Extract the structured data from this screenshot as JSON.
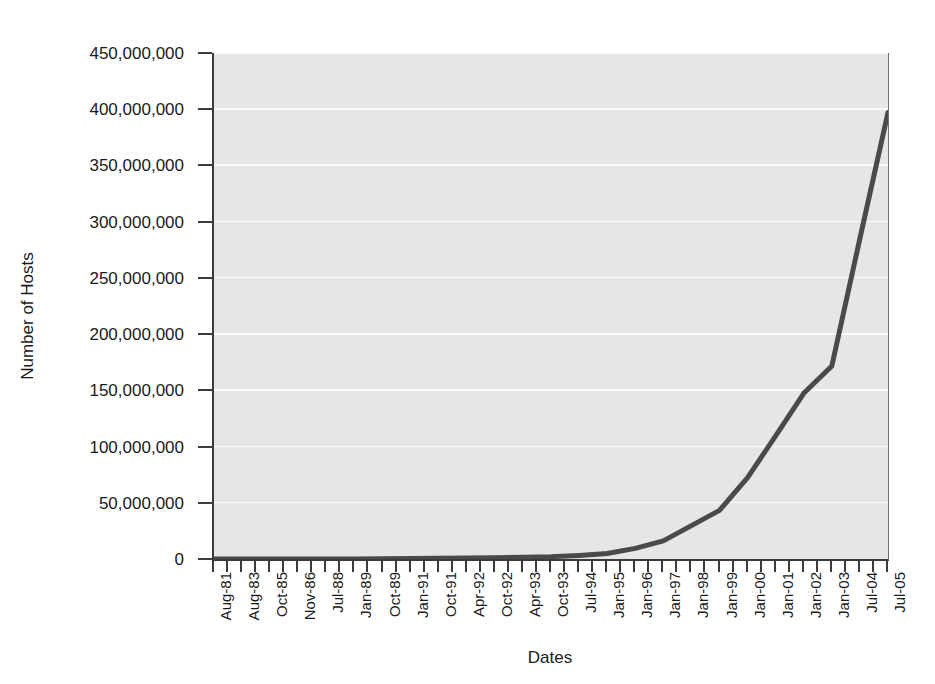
{
  "chart_data": {
    "type": "line",
    "title": "",
    "subtitle": "",
    "xlabel": "Dates",
    "ylabel": "Number of Hosts",
    "grid": true,
    "legend": "none",
    "ylim": [
      0,
      450000000
    ],
    "ytick_labels": [
      "450,000,000",
      "400,000,000",
      "350,000,000",
      "300,000,000",
      "250,000,000",
      "200,000,000",
      "150,000,000",
      "100,000,000",
      "50,000,000",
      "0"
    ],
    "ytick_values": [
      450000000,
      400000000,
      350000000,
      300000000,
      250000000,
      200000000,
      150000000,
      100000000,
      50000000,
      0
    ],
    "categories": [
      "Aug-81",
      "Aug-83",
      "Oct-85",
      "Nov-86",
      "Jul-88",
      "Jan-89",
      "Oct-89",
      "Jan-91",
      "Oct-91",
      "Apr-92",
      "Oct-92",
      "Apr-93",
      "Oct-93",
      "Jul-94",
      "Jan-95",
      "Jan-96",
      "Jan-97",
      "Jan-98",
      "Jan-99",
      "Jan-00",
      "Jan-01",
      "Jan-02",
      "Jan-03",
      "Jul-04",
      "Jul-05"
    ],
    "series": [
      {
        "name": "Number of Hosts",
        "color": "#4a4a4a",
        "line_width": 5,
        "values": [
          213,
          562,
          2063,
          5089,
          33000,
          80000,
          159000,
          376000,
          617000,
          890000,
          1136000,
          1486000,
          2056000,
          3212000,
          4852000,
          9472000,
          16146000,
          29670000,
          43230000,
          72398000,
          109574000,
          147344000,
          171638000,
          285139000,
          397000000
        ]
      }
    ],
    "annotations": []
  },
  "axes": {
    "plot_background_color": "#e6e6e6",
    "gridline_color": "#fbfbfb",
    "axis_line_color": "#3b3b3b"
  }
}
